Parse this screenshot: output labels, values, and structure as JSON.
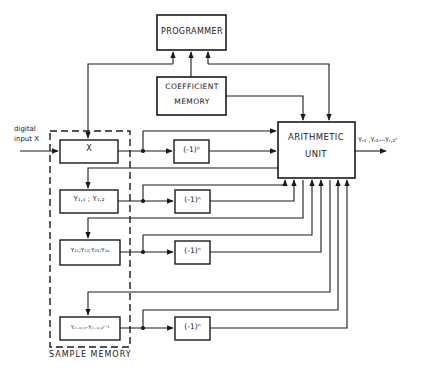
{
  "diagram": {
    "blocks": {
      "programmer": "PROGRAMMER",
      "coefficient_memory_line1": "COEFFICIENT",
      "coefficient_memory_line2": "MEMORY",
      "arithmetic_unit_line1": "ARITHMETIC",
      "arithmetic_unit_line2": "UNIT",
      "sample_memory": "SAMPLE MEMORY"
    },
    "input": {
      "line1": "digital",
      "line2": "input X"
    },
    "output": "Yᵣ₁ ,Yᵣ₂---Yᵣ,₂ʳ",
    "memory_cells": [
      {
        "id": "x",
        "label": "X"
      },
      {
        "id": "y1",
        "label": "Y₁,₁ ; Y₁,₂"
      },
      {
        "id": "y2",
        "label": "Y₂₁;Y₂₂;Y₂₃;Y₂₄"
      },
      {
        "id": "yr",
        "label": "Y₍ᵣ₋₁₎,₁–Y₍ᵣ₋₁₎,₂ʳ⁻¹"
      }
    ],
    "sign_blocks": [
      {
        "label": "(-1)ⁿ"
      },
      {
        "label": "(-1)ⁿ"
      },
      {
        "label": "(-1)ⁿ"
      },
      {
        "label": "(-1)ⁿ"
      }
    ]
  }
}
